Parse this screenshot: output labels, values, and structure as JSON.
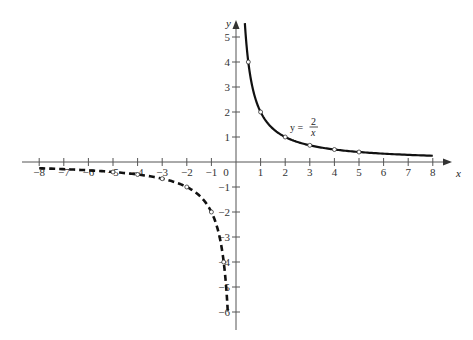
{
  "chart_data": {
    "type": "line",
    "title": "",
    "xlabel": "x",
    "ylabel": "y",
    "xlim": [
      -8,
      8
    ],
    "ylim": [
      -6,
      5.5
    ],
    "x_ticks": [
      -8,
      -7,
      -6,
      -5,
      -4,
      -3,
      -2,
      -1,
      0,
      1,
      2,
      3,
      4,
      5,
      6,
      7,
      8
    ],
    "y_ticks": [
      -6,
      -5,
      -4,
      -3,
      -2,
      -1,
      1,
      2,
      3,
      4,
      5
    ],
    "grid": false,
    "annotation": {
      "text_lhs": "y =",
      "numerator": "2",
      "denominator": "x",
      "position": [
        2.4,
        1.3
      ]
    },
    "series": [
      {
        "name": "y = 2/x (x > 0)",
        "style": "solid",
        "function": "2/x",
        "domain": [
          0.36,
          8
        ],
        "points": [
          [
            0.5,
            4
          ],
          [
            1,
            2
          ],
          [
            2,
            1
          ],
          [
            3,
            0.667
          ],
          [
            4,
            0.5
          ],
          [
            5,
            0.4
          ]
        ]
      },
      {
        "name": "y = 2/x (x < 0)",
        "style": "dashed",
        "function": "2/x",
        "domain": [
          -8,
          -0.33
        ],
        "points": [
          [
            -0.5,
            -4
          ],
          [
            -1,
            -2
          ],
          [
            -2,
            -1
          ],
          [
            -3,
            -0.667
          ],
          [
            -4,
            -0.5
          ],
          [
            -5,
            -0.4
          ]
        ]
      }
    ]
  },
  "labels": {
    "x_axis": "x",
    "y_axis": "y",
    "eq_lhs": "y =",
    "eq_num": "2",
    "eq_den": "x"
  }
}
